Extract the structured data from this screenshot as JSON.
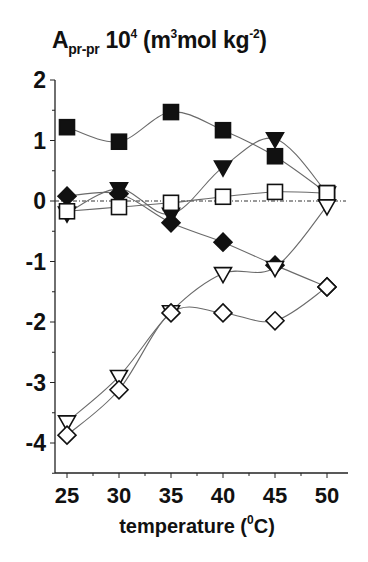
{
  "chart_data": {
    "type": "line",
    "title_parts": {
      "main": "A",
      "sub": "pr-pr",
      "mid": " 10",
      "sup1": "4",
      "unit_open": " (m",
      "sup2": "3",
      "unit_mid": "mol kg",
      "sup3": "-2",
      "unit_close": ")"
    },
    "xlabel": "temperature (0C)",
    "xlabel_parts": {
      "text": "temperature (",
      "sup": "0",
      "unit": "C)"
    },
    "ylabel": "",
    "x": [
      25,
      30,
      35,
      40,
      45,
      50
    ],
    "xlim": [
      23.7,
      52
    ],
    "ylim": [
      -4.5,
      2
    ],
    "xticks": [
      25,
      30,
      35,
      40,
      45,
      50
    ],
    "yticks": [
      2,
      1,
      0,
      -1,
      -2,
      -3,
      -4
    ],
    "grid": false,
    "legend": null,
    "reference_line": {
      "y": 0,
      "style": "dash-dot"
    },
    "series": [
      {
        "name": "filled-square",
        "marker": "square",
        "filled": true,
        "values": [
          1.22,
          0.98,
          1.47,
          1.17,
          0.74,
          0.13
        ]
      },
      {
        "name": "filled-triangle-down",
        "marker": "triangle-down",
        "filled": true,
        "values": [
          -0.2,
          0.2,
          -0.22,
          0.56,
          1.03,
          0.13
        ]
      },
      {
        "name": "filled-diamond",
        "marker": "diamond",
        "filled": true,
        "values": [
          0.08,
          0.12,
          -0.36,
          -0.68,
          -1.06,
          -1.42
        ]
      },
      {
        "name": "open-square",
        "marker": "square",
        "filled": false,
        "values": [
          -0.17,
          -0.1,
          -0.03,
          0.07,
          0.15,
          0.13
        ]
      },
      {
        "name": "open-triangle-down",
        "marker": "triangle-down",
        "filled": false,
        "values": [
          -3.65,
          -2.9,
          -1.83,
          -1.2,
          -1.1,
          -0.08
        ]
      },
      {
        "name": "open-diamond",
        "marker": "diamond",
        "filled": false,
        "values": [
          -3.87,
          -3.12,
          -1.85,
          -1.85,
          -1.98,
          -1.42
        ]
      }
    ]
  },
  "colors": {
    "axis": "#222222",
    "line": "#6a6a6a",
    "marker": "#111111",
    "background": "#ffffff"
  }
}
